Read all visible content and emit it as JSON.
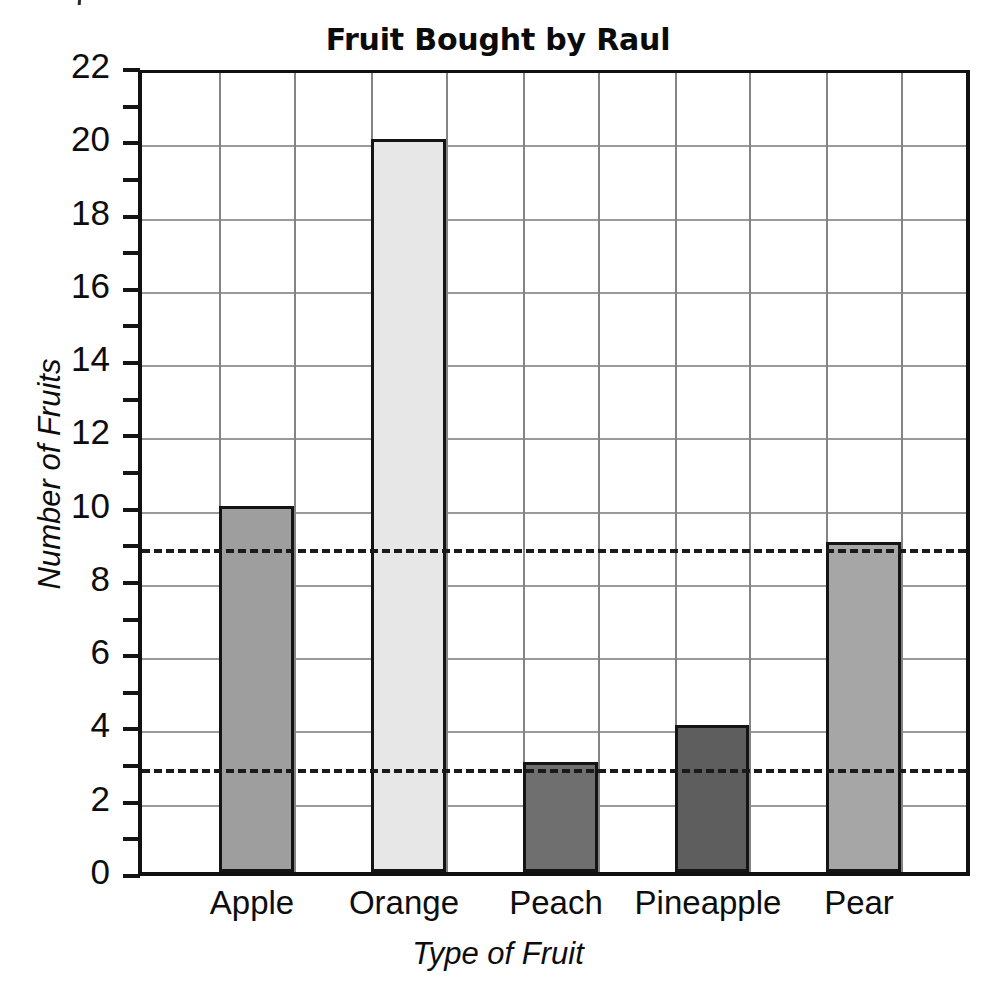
{
  "chart_data": {
    "type": "bar",
    "title": "Fruit Bought by Raul",
    "xlabel": "Type of Fruit",
    "ylabel": "Number of Fruits",
    "categories": [
      "Apple",
      "Orange",
      "Peach",
      "Pineapple",
      "Pear"
    ],
    "values": [
      10,
      20,
      3,
      4,
      9
    ],
    "bar_colors": [
      "#9e9e9e",
      "#e7e7e7",
      "#6f6f6f",
      "#5e5e5e",
      "#a6a6a6"
    ],
    "bar_border_color": "#141414",
    "ylim": [
      0,
      22
    ],
    "ytick_step": 2,
    "yticks": [
      0,
      2,
      4,
      6,
      8,
      10,
      12,
      14,
      16,
      18,
      20,
      22
    ],
    "ytick_labels": [
      "0",
      "2",
      "4",
      "6",
      "8",
      "10",
      "12",
      "14",
      "16",
      "18",
      "20",
      "22"
    ],
    "yminor_ticks": [
      1,
      3,
      5,
      7,
      9,
      11,
      13,
      15,
      17,
      19,
      21
    ],
    "grid": true,
    "grid_axes": "both",
    "vertical_gridline_count": 10,
    "reference_lines": [
      {
        "value": 9,
        "style": "dashed",
        "color": "#1a1a1a"
      },
      {
        "value": 3,
        "style": "dashed",
        "color": "#1a1a1a"
      }
    ],
    "legend": null,
    "annotations": []
  },
  "geometry": {
    "plot_left": 138,
    "plot_top": 70,
    "plot_width": 832,
    "plot_height": 806,
    "bars": [
      {
        "category": "Apple",
        "value": 10,
        "x": 77,
        "width": 75,
        "color": "#9e9e9e"
      },
      {
        "category": "Orange",
        "value": 20,
        "x": 229,
        "width": 75,
        "color": "#e7e7e7"
      },
      {
        "category": "Peach",
        "value": 3,
        "x": 381,
        "width": 75,
        "color": "#6f6f6f"
      },
      {
        "category": "Pineapple",
        "value": 4,
        "x": 533,
        "width": 74,
        "color": "#5e5e5e"
      },
      {
        "category": "Pear",
        "value": 9,
        "x": 684,
        "width": 75,
        "color": "#a6a6a6"
      }
    ],
    "vgrids": [
      77,
      152,
      229,
      304,
      381,
      456,
      533,
      607,
      684,
      759
    ],
    "xlabel_centers": [
      252,
      404,
      556,
      708,
      859
    ]
  }
}
